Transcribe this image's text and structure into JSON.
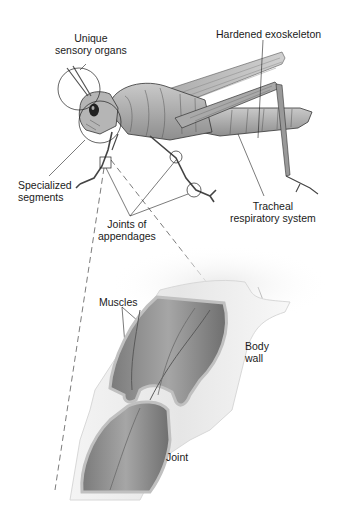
{
  "diagram": {
    "colors": {
      "background": "#ffffff",
      "body_fill": "#b8b8b8",
      "body_shade": "#8a8a8a",
      "outline": "#2a2a2a",
      "text": "#1a1a1a",
      "leg_outer": "#ececec",
      "leg_inner": "#9a9a9a"
    },
    "labels": {
      "sensory": [
        "Unique",
        "sensory organs"
      ],
      "exoskeleton": [
        "Hardened exoskeleton"
      ],
      "segments": [
        "Specialized",
        "segments"
      ],
      "joints_appendages": [
        "Joints of",
        "appendages"
      ],
      "tracheal": [
        "Tracheal",
        "respiratory system"
      ],
      "muscles": [
        "Muscles"
      ],
      "body_wall": [
        "Body",
        "wall"
      ],
      "joint": [
        "Joint"
      ]
    }
  }
}
